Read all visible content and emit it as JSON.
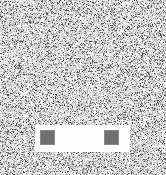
{
  "canvas": {
    "width": 166,
    "height": 175,
    "background_color": "#f2f2f2",
    "description": "noise-field"
  },
  "noise": {
    "type": "salt-and-pepper",
    "base_color": "#f4f4f4",
    "dark_color": "#4a4a4a",
    "mid_color": "#b4b4b4",
    "light_color": "#ffffff",
    "density": 0.55,
    "pixel_size": 1,
    "seed": 20240517
  },
  "panel": {
    "name": "white-band",
    "fill_color": "#fdfdfd",
    "x": 35,
    "y": 125,
    "width": 95,
    "height": 27
  },
  "marks": [
    {
      "name": "left-square",
      "fill_color": "#6f6f6f",
      "edge_color": "#8a8a8a",
      "x": 40,
      "y": 130,
      "width": 15,
      "height": 15
    },
    {
      "name": "right-square",
      "fill_color": "#6f6f6f",
      "edge_color": "#8a8a8a",
      "x": 104,
      "y": 130,
      "width": 15,
      "height": 15
    }
  ]
}
